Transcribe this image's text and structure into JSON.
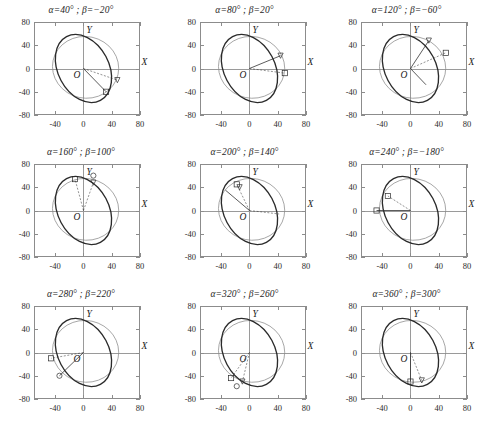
{
  "figure": {
    "type": "multi-panel-parametric-plot",
    "rows": 3,
    "cols": 3,
    "axis_labels": {
      "x": "X",
      "y": "Y",
      "origin": "O"
    },
    "xticks": [
      "-40",
      "0",
      "40",
      "80"
    ],
    "xtick_values": [
      -40,
      0,
      40,
      80
    ],
    "yticks": [
      "80",
      "40",
      "0",
      "-40",
      "-80"
    ],
    "ytick_values": [
      80,
      40,
      0,
      -40,
      -80
    ],
    "xlim": [
      -70,
      80
    ],
    "ylim": [
      -80,
      80
    ],
    "colors": {
      "thick_curve": "#2b2b2b",
      "thin_curve": "#8a8a8a",
      "axis": "#9a9a9a",
      "frame": "#8c8c8c",
      "text": "#1a1a1a"
    }
  },
  "chart_data": {
    "type": "line",
    "title": "",
    "xlabel": "X",
    "ylabel": "Y",
    "xlim": [
      -70,
      80
    ],
    "ylim": [
      -80,
      80
    ],
    "grid": false,
    "legend": "none",
    "panels": [
      {
        "index": 0,
        "title": "α=40° ;  β=−20°",
        "alpha_deg": 40,
        "beta_deg": -20,
        "series": [
          {
            "name": "reference-ellipse",
            "style": "thin",
            "type": "ellipse",
            "cx": 3,
            "cy": 2,
            "rx": 47,
            "ry": 53,
            "rotation_deg": -12
          },
          {
            "name": "deformed-ellipse",
            "style": "thick",
            "type": "ellipse",
            "cx": 0,
            "cy": 0,
            "rx": 36,
            "ry": 62,
            "rotation_deg": 28
          }
        ],
        "markers": [
          {
            "name": "square-marker",
            "shape": "square",
            "x": 32,
            "y": -40
          },
          {
            "name": "triangle-marker",
            "shape": "triangle",
            "x": 48,
            "y": -20
          }
        ],
        "vectors": [
          {
            "from": [
              0,
              0
            ],
            "to": [
              32,
              -40
            ],
            "style": "solid"
          },
          {
            "from": [
              0,
              0
            ],
            "to": [
              48,
              -20
            ],
            "style": "dashed"
          }
        ]
      },
      {
        "index": 1,
        "title": "α=80° ;  β=20°",
        "alpha_deg": 80,
        "beta_deg": 20,
        "series": [
          {
            "name": "reference-ellipse",
            "style": "thin",
            "type": "ellipse",
            "cx": 3,
            "cy": 2,
            "rx": 47,
            "ry": 53,
            "rotation_deg": -12
          },
          {
            "name": "deformed-ellipse",
            "style": "thick",
            "type": "ellipse",
            "cx": 0,
            "cy": 0,
            "rx": 36,
            "ry": 62,
            "rotation_deg": 28
          }
        ],
        "markers": [
          {
            "name": "square-marker",
            "shape": "square",
            "x": 50,
            "y": -8
          },
          {
            "name": "triangle-marker",
            "shape": "triangle",
            "x": 44,
            "y": 22
          }
        ],
        "vectors": [
          {
            "from": [
              0,
              0
            ],
            "to": [
              44,
              22
            ],
            "style": "solid"
          },
          {
            "from": [
              0,
              0
            ],
            "to": [
              50,
              -8
            ],
            "style": "dashed"
          }
        ]
      },
      {
        "index": 2,
        "title": "α=120° ;  β=−60°",
        "alpha_deg": 120,
        "beta_deg": -60,
        "series": [
          {
            "name": "reference-ellipse",
            "style": "thin",
            "type": "ellipse",
            "cx": 3,
            "cy": 2,
            "rx": 47,
            "ry": 53,
            "rotation_deg": -12
          },
          {
            "name": "deformed-ellipse",
            "style": "thick",
            "type": "ellipse",
            "cx": 0,
            "cy": 0,
            "rx": 36,
            "ry": 62,
            "rotation_deg": 28
          }
        ],
        "markers": [
          {
            "name": "square-marker",
            "shape": "square",
            "x": 50,
            "y": 27
          },
          {
            "name": "triangle-marker",
            "shape": "triangle",
            "x": 26,
            "y": 48
          }
        ],
        "vectors": [
          {
            "from": [
              0,
              0
            ],
            "to": [
              26,
              48
            ],
            "style": "solid"
          },
          {
            "from": [
              0,
              0
            ],
            "to": [
              50,
              27
            ],
            "style": "dashed"
          },
          {
            "from": [
              0,
              0
            ],
            "to": [
              22,
              -28
            ],
            "style": "solid"
          }
        ]
      },
      {
        "index": 3,
        "title": "α=160° ;  β=100°",
        "alpha_deg": 160,
        "beta_deg": 100,
        "series": [
          {
            "name": "reference-ellipse",
            "style": "thin",
            "type": "ellipse",
            "cx": 3,
            "cy": 2,
            "rx": 47,
            "ry": 53,
            "rotation_deg": -12
          },
          {
            "name": "deformed-ellipse",
            "style": "thick",
            "type": "ellipse",
            "cx": 0,
            "cy": 0,
            "rx": 36,
            "ry": 62,
            "rotation_deg": 28
          }
        ],
        "markers": [
          {
            "name": "square-marker",
            "shape": "square",
            "x": -12,
            "y": 54
          },
          {
            "name": "triangle-marker",
            "shape": "triangle",
            "x": 14,
            "y": 48
          },
          {
            "name": "circle-marker",
            "shape": "circle",
            "x": 14,
            "y": 60
          }
        ],
        "vectors": [
          {
            "from": [
              0,
              0
            ],
            "to": [
              14,
              48
            ],
            "style": "dashed"
          },
          {
            "from": [
              0,
              0
            ],
            "to": [
              -12,
              54
            ],
            "style": "dashed"
          }
        ]
      },
      {
        "index": 4,
        "title": "α=200° ;  β=140°",
        "alpha_deg": 200,
        "beta_deg": 140,
        "series": [
          {
            "name": "reference-ellipse",
            "style": "thin",
            "type": "ellipse",
            "cx": 3,
            "cy": 2,
            "rx": 47,
            "ry": 53,
            "rotation_deg": -12
          },
          {
            "name": "deformed-ellipse",
            "style": "thick",
            "type": "ellipse",
            "cx": 0,
            "cy": 0,
            "rx": 36,
            "ry": 62,
            "rotation_deg": 28
          }
        ],
        "markers": [
          {
            "name": "square-marker",
            "shape": "square",
            "x": -18,
            "y": 45
          },
          {
            "name": "triangle-marker",
            "shape": "triangle",
            "x": -14,
            "y": 40
          }
        ],
        "vectors": [
          {
            "from": [
              0,
              0
            ],
            "to": [
              -18,
              45
            ],
            "style": "dashed"
          },
          {
            "from": [
              0,
              0
            ],
            "to": [
              -34,
              35
            ],
            "style": "solid"
          },
          {
            "from": [
              0,
              0
            ],
            "to": [
              42,
              -6
            ],
            "style": "dashed"
          }
        ]
      },
      {
        "index": 5,
        "title": "α=240° ;  β=−180°",
        "alpha_deg": 240,
        "beta_deg": -180,
        "series": [
          {
            "name": "reference-ellipse",
            "style": "thin",
            "type": "ellipse",
            "cx": 3,
            "cy": 2,
            "rx": 47,
            "ry": 53,
            "rotation_deg": -12
          },
          {
            "name": "deformed-ellipse",
            "style": "thick",
            "type": "ellipse",
            "cx": 0,
            "cy": 0,
            "rx": 36,
            "ry": 62,
            "rotation_deg": 28
          }
        ],
        "markers": [
          {
            "name": "square-marker",
            "shape": "square",
            "x": -32,
            "y": 25
          },
          {
            "name": "square-marker-2",
            "shape": "square",
            "x": -48,
            "y": 0
          }
        ],
        "vectors": [
          {
            "from": [
              0,
              0
            ],
            "to": [
              -32,
              25
            ],
            "style": "dashed"
          },
          {
            "from": [
              0,
              0
            ],
            "to": [
              -48,
              0
            ],
            "style": "solid"
          }
        ]
      },
      {
        "index": 6,
        "title": "α=280° ;  β=220°",
        "alpha_deg": 280,
        "beta_deg": 220,
        "series": [
          {
            "name": "reference-ellipse",
            "style": "thin",
            "type": "ellipse",
            "cx": 3,
            "cy": 2,
            "rx": 47,
            "ry": 53,
            "rotation_deg": -12
          },
          {
            "name": "deformed-ellipse",
            "style": "thick",
            "type": "ellipse",
            "cx": 0,
            "cy": 0,
            "rx": 36,
            "ry": 62,
            "rotation_deg": 28
          }
        ],
        "markers": [
          {
            "name": "square-marker",
            "shape": "square",
            "x": -46,
            "y": -10
          },
          {
            "name": "circle-marker",
            "shape": "circle",
            "x": -34,
            "y": -40
          }
        ],
        "vectors": [
          {
            "from": [
              0,
              0
            ],
            "to": [
              -46,
              -10
            ],
            "style": "dashed"
          },
          {
            "from": [
              0,
              0
            ],
            "to": [
              -34,
              -40
            ],
            "style": "solid"
          }
        ]
      },
      {
        "index": 7,
        "title": "α=320° ;  β=260°",
        "alpha_deg": 320,
        "beta_deg": 260,
        "series": [
          {
            "name": "reference-ellipse",
            "style": "thin",
            "type": "ellipse",
            "cx": 3,
            "cy": 2,
            "rx": 47,
            "ry": 53,
            "rotation_deg": -12
          },
          {
            "name": "deformed-ellipse",
            "style": "thick",
            "type": "ellipse",
            "cx": 0,
            "cy": 0,
            "rx": 36,
            "ry": 62,
            "rotation_deg": 28
          }
        ],
        "markers": [
          {
            "name": "square-marker",
            "shape": "square",
            "x": -26,
            "y": -44
          },
          {
            "name": "triangle-marker",
            "shape": "triangle",
            "x": -10,
            "y": -50
          },
          {
            "name": "circle-marker",
            "shape": "circle",
            "x": -18,
            "y": -58
          }
        ],
        "vectors": [
          {
            "from": [
              0,
              0
            ],
            "to": [
              -26,
              -44
            ],
            "style": "dashed"
          },
          {
            "from": [
              0,
              0
            ],
            "to": [
              -10,
              -50
            ],
            "style": "dashed"
          }
        ]
      },
      {
        "index": 8,
        "title": "α=360° ;  β=300°",
        "alpha_deg": 360,
        "beta_deg": 300,
        "series": [
          {
            "name": "reference-ellipse",
            "style": "thin",
            "type": "ellipse",
            "cx": 3,
            "cy": 2,
            "rx": 47,
            "ry": 53,
            "rotation_deg": -12
          },
          {
            "name": "deformed-ellipse",
            "style": "thick",
            "type": "ellipse",
            "cx": 0,
            "cy": 0,
            "rx": 36,
            "ry": 62,
            "rotation_deg": 28
          }
        ],
        "markers": [
          {
            "name": "square-marker",
            "shape": "square",
            "x": 0,
            "y": -50
          },
          {
            "name": "triangle-marker",
            "shape": "triangle",
            "x": 16,
            "y": -48
          }
        ],
        "vectors": [
          {
            "from": [
              0,
              0
            ],
            "to": [
              0,
              -50
            ],
            "style": "solid"
          },
          {
            "from": [
              0,
              0
            ],
            "to": [
              16,
              -48
            ],
            "style": "dashed"
          }
        ]
      }
    ]
  }
}
